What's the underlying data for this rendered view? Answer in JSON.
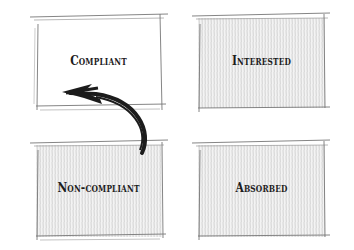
{
  "diagram": {
    "style": "hand-sketched quadrant",
    "quadrants": [
      {
        "id": "top-left",
        "label": "Compliant",
        "shaded": false
      },
      {
        "id": "top-right",
        "label": "Interested",
        "shaded": true
      },
      {
        "id": "bottom-left",
        "label": "Non-compliant",
        "shaded": true
      },
      {
        "id": "bottom-right",
        "label": "Absorbed",
        "shaded": true
      }
    ],
    "arrow": {
      "from": "Non-compliant",
      "to": "Compliant",
      "shape": "curved"
    },
    "colors": {
      "ink": "#1c1c1c",
      "sketch_line": "#6a6a6a",
      "hatch": "#c4c4c4"
    }
  }
}
